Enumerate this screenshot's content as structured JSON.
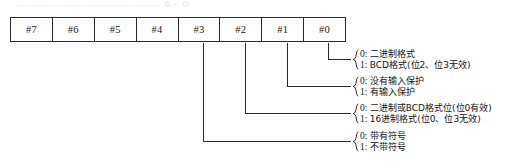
{
  "ghost_text": "— ——  —  —— ————— ———        ⊙  ⌐  ⊙",
  "bit_table": {
    "name": "control-byte-bit-map",
    "cells": [
      {
        "label": "#7"
      },
      {
        "label": "#6"
      },
      {
        "label": "#5"
      },
      {
        "label": "#4"
      },
      {
        "label": "#3"
      },
      {
        "label": "#2"
      },
      {
        "label": "#1"
      },
      {
        "label": "#0"
      }
    ]
  },
  "annotations": [
    {
      "source_bit": "#0",
      "rows": [
        {
          "key": "0:",
          "text": "二进制格式"
        },
        {
          "key": "1:",
          "text": "BCD格式(位2、位3无效)"
        }
      ]
    },
    {
      "source_bit": "#1",
      "rows": [
        {
          "key": "0:",
          "text": "没有输入保护"
        },
        {
          "key": "1:",
          "text": "有输入保护"
        }
      ]
    },
    {
      "source_bit": "#2",
      "rows": [
        {
          "key": "0:",
          "text": "二进制或BCD格式位(位0有效)"
        },
        {
          "key": "1:",
          "text": "16进制格式(位0、位3无效)"
        }
      ]
    },
    {
      "source_bit": "#3",
      "rows": [
        {
          "key": "0:",
          "text": "带有符号"
        },
        {
          "key": "1:",
          "text": "不带符号"
        }
      ]
    }
  ],
  "colors": {
    "line": "#2b2b2b",
    "text": "#141414",
    "background": "#ffffff"
  }
}
